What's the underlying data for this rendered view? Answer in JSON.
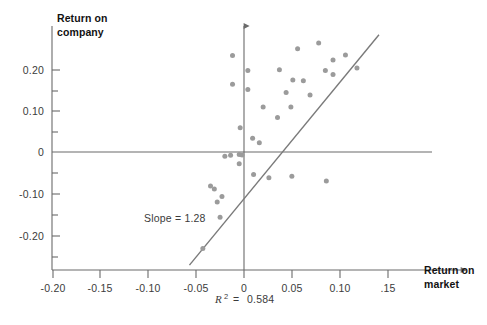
{
  "chart_data": {
    "type": "scatter",
    "title": "",
    "xlabel": "Return on market",
    "ylabel": "Return on company",
    "xlim": [
      -0.215,
      0.165
    ],
    "ylim": [
      -0.28,
      0.285
    ],
    "grid": false,
    "legend": null,
    "xticks": [
      -0.2,
      -0.15,
      -0.1,
      -0.05,
      0,
      0.05,
      0.1,
      0.15
    ],
    "xtick_labels": [
      "-0.20",
      "-0.15",
      "-0.10",
      "-0.05",
      "0",
      "0.05",
      "0.10",
      ".15"
    ],
    "yticks": [
      -0.2,
      -0.15,
      -0.1,
      -0.05,
      0,
      0.05,
      0.1,
      0.15,
      0.2,
      0.25
    ],
    "ytick_labels": [
      "-0.20",
      "",
      "-0.10",
      "",
      "0",
      "",
      "0.10",
      "",
      "0.20",
      ""
    ],
    "ytick_major_labels": [
      "0.20",
      "0.10",
      "0",
      "-0.10",
      "-0.20"
    ],
    "points": [
      {
        "x": -0.012,
        "y": 0.232
      },
      {
        "x": -0.012,
        "y": 0.163
      },
      {
        "x": 0.004,
        "y": 0.196
      },
      {
        "x": 0.004,
        "y": 0.15
      },
      {
        "x": 0.02,
        "y": 0.108
      },
      {
        "x": 0.035,
        "y": 0.083
      },
      {
        "x": 0.037,
        "y": 0.198
      },
      {
        "x": 0.044,
        "y": 0.143
      },
      {
        "x": 0.049,
        "y": 0.108
      },
      {
        "x": 0.051,
        "y": 0.173
      },
      {
        "x": 0.056,
        "y": 0.248
      },
      {
        "x": 0.062,
        "y": 0.171
      },
      {
        "x": 0.069,
        "y": 0.137
      },
      {
        "x": 0.078,
        "y": 0.262
      },
      {
        "x": 0.085,
        "y": 0.196
      },
      {
        "x": 0.093,
        "y": 0.221
      },
      {
        "x": 0.093,
        "y": 0.186
      },
      {
        "x": 0.106,
        "y": 0.233
      },
      {
        "x": 0.118,
        "y": 0.202
      },
      {
        "x": -0.004,
        "y": 0.058
      },
      {
        "x": 0.009,
        "y": 0.033
      },
      {
        "x": 0.016,
        "y": 0.022
      },
      {
        "x": -0.014,
        "y": -0.008
      },
      {
        "x": -0.02,
        "y": -0.01
      },
      {
        "x": -0.005,
        "y": -0.006
      },
      {
        "x": -0.002,
        "y": -0.007
      },
      {
        "x": -0.005,
        "y": -0.028
      },
      {
        "x": 0.01,
        "y": -0.054
      },
      {
        "x": 0.026,
        "y": -0.062
      },
      {
        "x": 0.05,
        "y": -0.058
      },
      {
        "x": 0.086,
        "y": -0.07
      },
      {
        "x": -0.031,
        "y": -0.089
      },
      {
        "x": -0.023,
        "y": -0.107
      },
      {
        "x": -0.028,
        "y": -0.12
      },
      {
        "x": -0.035,
        "y": -0.082
      },
      {
        "x": -0.025,
        "y": -0.157
      },
      {
        "x": -0.043,
        "y": -0.232
      }
    ],
    "regression_line": {
      "slope": 1.28,
      "x_start": -0.057,
      "y_start": -0.272,
      "x_end": 0.141,
      "y_end": 0.282
    },
    "annotations": [
      {
        "name": "slope-annotation",
        "text": "Slope  =  1.28",
        "x": -0.087,
        "y": -0.142
      }
    ],
    "r_squared": {
      "symbol": "R",
      "exponent": "2",
      "equals": "=",
      "value": "0.584"
    },
    "point_color": "#9b9b9b",
    "line_color": "#7a7a7a",
    "axis_color": "#6b6b6b",
    "text_color": "#3b3b3b",
    "title_color": "#121212",
    "background": "#ffffff"
  }
}
